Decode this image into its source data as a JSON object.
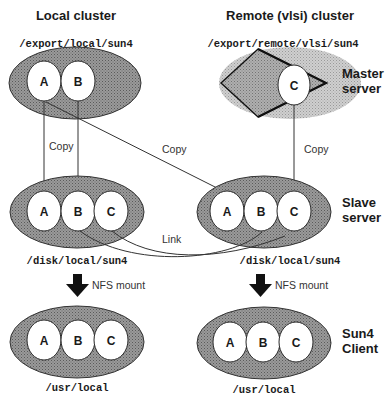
{
  "columns": {
    "local": "Local cluster",
    "remote": "Remote (vlsi) cluster"
  },
  "rows": {
    "master": [
      "Master",
      "server"
    ],
    "slave": [
      "Slave",
      "server"
    ],
    "client": [
      "Sun4",
      "Client"
    ]
  },
  "paths": {
    "local_master": "/export/local/sun4",
    "remote_master": "/export/remote/vlsi/sun4",
    "local_slave": "/disk/local/sun4",
    "remote_slave": "/disk/local/sun4",
    "local_client": "/usr/local",
    "remote_client": "/usr/local"
  },
  "nodes": {
    "local_master": [
      "A",
      "B"
    ],
    "remote_master": [
      "C"
    ],
    "local_slave": [
      "A",
      "B",
      "C"
    ],
    "remote_slave": [
      "A",
      "B",
      "C"
    ],
    "local_client": [
      "A",
      "B",
      "C"
    ],
    "remote_client": [
      "A",
      "B",
      "C"
    ]
  },
  "edges": {
    "copy_local": "Copy",
    "copy_cross": "Copy",
    "copy_remote": "Copy",
    "link": "Link",
    "nfs_local": "NFS mount",
    "nfs_remote": "NFS mount"
  },
  "colors": {
    "ellipse_fill": "#8f8f8f",
    "ellipse_light": "#c4c4c4",
    "circle_fill": "#ffffff",
    "ink": "#1a1a1a"
  }
}
